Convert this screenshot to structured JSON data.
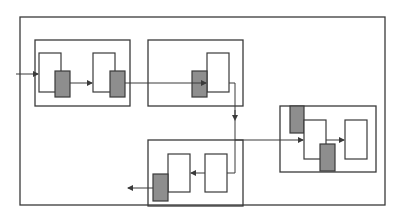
{
  "diagram": {
    "type": "block-diagram",
    "colors": {
      "stroke": "#3a3a3a",
      "shaded_block": "#8e8e8e",
      "background": "#ffffff"
    },
    "groups": [
      {
        "id": "group-1",
        "blocks": [
          "white",
          "gray",
          "white",
          "gray"
        ]
      },
      {
        "id": "group-2",
        "blocks": [
          "gray",
          "white"
        ]
      },
      {
        "id": "group-3",
        "blocks": [
          "gray",
          "white",
          "gray",
          "white"
        ]
      },
      {
        "id": "group-4",
        "blocks": [
          "gray",
          "white",
          "white"
        ]
      }
    ],
    "labels": []
  }
}
